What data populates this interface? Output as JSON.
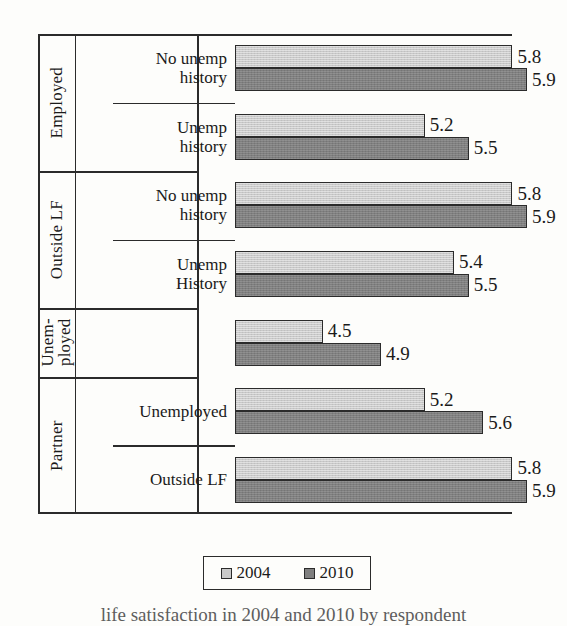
{
  "chart_data": {
    "type": "bar",
    "orientation": "horizontal",
    "title": "",
    "xlabel": "",
    "ylabel": "",
    "xlim": [
      3.9,
      6.05
    ],
    "grid": false,
    "legend_position": "bottom",
    "series": [
      {
        "name": "2004",
        "color": "#c9c9c9",
        "values": [
          5.8,
          5.2,
          5.8,
          5.4,
          4.5,
          5.2,
          5.8
        ]
      },
      {
        "name": "2010",
        "color": "#7f7f7f",
        "values": [
          5.9,
          5.5,
          5.9,
          5.5,
          4.9,
          5.6,
          5.9
        ]
      }
    ],
    "categories": [
      "Employed / No unemp history",
      "Employed / Unemp history",
      "Outside LF / No unemp history",
      "Outside LF / Unemp History",
      "Unemployed",
      "Partner / Unemployed",
      "Partner / Outside LF"
    ],
    "groups": [
      {
        "label": "Employed",
        "label_lines": [
          "Employed"
        ],
        "rows": [
          {
            "label_lines": [
              "No unemp",
              "history"
            ],
            "v2004": 5.8,
            "v2010": 5.9
          },
          {
            "label_lines": [
              "Unemp",
              "history"
            ],
            "v2004": 5.2,
            "v2010": 5.5
          }
        ]
      },
      {
        "label": "Outside LF",
        "label_lines": [
          "Outside LF"
        ],
        "rows": [
          {
            "label_lines": [
              "No unemp",
              "history"
            ],
            "v2004": 5.8,
            "v2010": 5.9
          },
          {
            "label_lines": [
              "Unemp",
              "History"
            ],
            "v2004": 5.4,
            "v2010": 5.5
          }
        ]
      },
      {
        "label": "Unem-ployed",
        "label_lines": [
          "Unem-",
          "ployed"
        ],
        "rows": [
          {
            "label_lines": [],
            "v2004": 4.5,
            "v2010": 4.9
          }
        ]
      },
      {
        "label": "Partner",
        "label_lines": [
          "Partner"
        ],
        "rows": [
          {
            "label_lines": [
              "Unemployed"
            ],
            "v2004": 5.2,
            "v2010": 5.6
          },
          {
            "label_lines": [
              "Outside LF"
            ],
            "v2004": 5.8,
            "v2010": 5.9
          }
        ]
      }
    ]
  },
  "legend": {
    "items": [
      {
        "label": "2004",
        "swatch": "s2004"
      },
      {
        "label": "2010",
        "swatch": "s2010"
      }
    ]
  },
  "caption": {
    "text": "life satisfaction in 2004 and 2010 by respondent"
  }
}
